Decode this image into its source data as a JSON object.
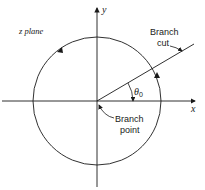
{
  "diagram": {
    "plane_label": "z plane",
    "axes": {
      "x_label": "x",
      "y_label": "y"
    },
    "angle_label": "θ",
    "angle_subscript": "0",
    "annotations": {
      "branch_cut": [
        "Branch",
        "cut"
      ],
      "branch_point": [
        "Branch",
        "point"
      ]
    },
    "colors": {
      "stroke": "#1a1a1a",
      "background": "#ffffff"
    }
  }
}
